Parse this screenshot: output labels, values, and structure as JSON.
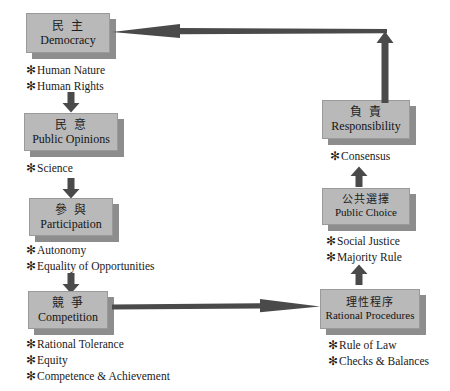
{
  "diagram": {
    "colors": {
      "box_fill": "#b9b9b9",
      "box_shadow": "#8d8d8d",
      "box_border": "#9a9a9a",
      "arrow": "#4a4a4a",
      "text": "#1a1a1a"
    },
    "nodes": [
      {
        "id": "democracy",
        "cn": "民 主",
        "en": "Democracy"
      },
      {
        "id": "public-opinions",
        "cn": "民 意",
        "en": "Public Opinions"
      },
      {
        "id": "participation",
        "cn": "參 與",
        "en": "Participation"
      },
      {
        "id": "competition",
        "cn": "競 爭",
        "en": "Competition"
      },
      {
        "id": "rational-procedures",
        "cn": "理性程序",
        "en": "Rational Procedures"
      },
      {
        "id": "public-choice",
        "cn": "公共選擇",
        "en": "Public Choice"
      },
      {
        "id": "responsibility",
        "cn": "負 責",
        "en": "Responsibility"
      }
    ],
    "bullet_groups": [
      {
        "id": "under-democracy",
        "items": [
          "Human Nature",
          "Human Rights"
        ]
      },
      {
        "id": "under-public-opinions",
        "items": [
          "Science"
        ]
      },
      {
        "id": "under-participation",
        "items": [
          "Autonomy",
          "Equality of Opportunities"
        ]
      },
      {
        "id": "under-competition",
        "items": [
          "Rational Tolerance",
          "Equity",
          "Competence & Achievement"
        ]
      },
      {
        "id": "under-rational-procedures",
        "items": [
          "Rule of Law",
          "Checks & Balances"
        ]
      },
      {
        "id": "under-public-choice",
        "items": [
          "Social Justice",
          "Majority Rule"
        ]
      },
      {
        "id": "under-responsibility",
        "items": [
          "Consensus"
        ]
      }
    ],
    "bullet_marker": "✻",
    "connectors": [
      {
        "id": "democracy-to-public-opinions",
        "direction": "down"
      },
      {
        "id": "public-opinions-to-participation",
        "direction": "down"
      },
      {
        "id": "participation-to-competition",
        "direction": "down"
      },
      {
        "id": "competition-to-rational-procedures",
        "direction": "right"
      },
      {
        "id": "rational-procedures-to-public-choice",
        "direction": "up"
      },
      {
        "id": "public-choice-to-responsibility",
        "direction": "up"
      },
      {
        "id": "responsibility-to-democracy",
        "direction": "up-then-left"
      }
    ]
  }
}
